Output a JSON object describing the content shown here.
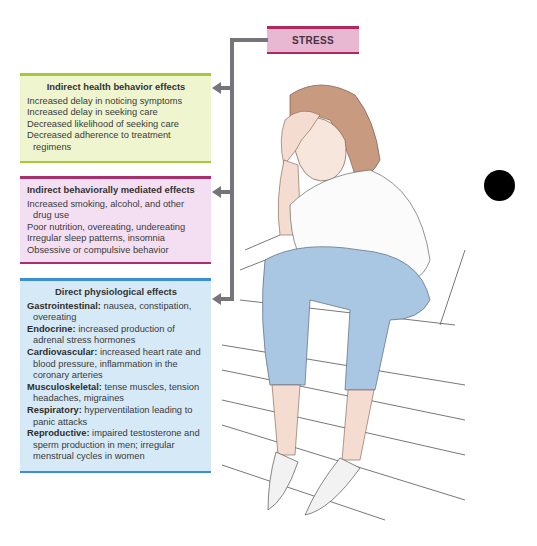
{
  "diagram": {
    "root": {
      "label": "STRESS",
      "border_color": "#b2285e",
      "fill_color": "#e8b8d2"
    },
    "connector_color": "#77747c",
    "boxes": [
      {
        "id": "indirect-health-behavior",
        "title": "Indirect health behavior effects",
        "border_color": "#a8c83a",
        "fill_color": "#eef5cf",
        "items": [
          "Increased delay in noticing symptoms",
          "Increased delay in seeking care",
          "Decreased likelihood of seeking care",
          "Decreased adherence to treatment regimens"
        ]
      },
      {
        "id": "indirect-behaviorally-mediated",
        "title": "Indirect behaviorally mediated effects",
        "border_color": "#a8306c",
        "fill_color": "#f4dff2",
        "items": [
          "Increased smoking, alcohol, and other drug use",
          "Poor nutrition, overeating, undereating",
          "Irregular sleep patterns, insomnia",
          "Obsessive or compulsive behavior"
        ]
      },
      {
        "id": "direct-physiological",
        "title": "Direct physiological effects",
        "border_color": "#3c8ed6",
        "fill_color": "#d6e9f7",
        "items": [
          {
            "system": "Gastrointestinal:",
            "effect": "nausea, constipation, overeating"
          },
          {
            "system": "Endocrine:",
            "effect": "increased production of adrenal stress hormones"
          },
          {
            "system": "Cardiovascular:",
            "effect": "increased heart rate and blood pressure, inflammation in the coronary arteries"
          },
          {
            "system": "Musculoskeletal:",
            "effect": "tense muscles, tension headaches, migraines"
          },
          {
            "system": "Respiratory:",
            "effect": "hyperventilation leading to panic attacks"
          },
          {
            "system": "Reproductive:",
            "effect": "impaired testosterone and sperm production in men; irregular menstrual cycles in women"
          }
        ]
      }
    ],
    "illustration": "stressed-woman-sitting-on-steps-holding-head"
  }
}
